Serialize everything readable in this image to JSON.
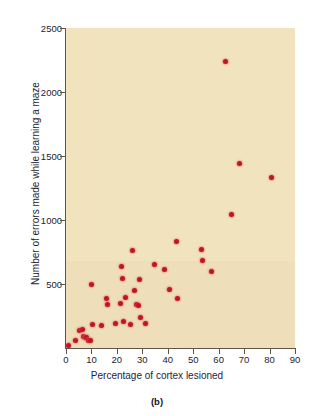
{
  "figure": {
    "panel_label": "(b)",
    "background_color": "#f2e3bf",
    "point_color": "#bd1626",
    "axis_color": "#5c5648",
    "text_color": "#1d2340"
  },
  "chart_data": {
    "type": "scatter",
    "title": "",
    "subtitle": "",
    "xlabel": "Percentage of cortex lesioned",
    "ylabel": "Number of errors made while learning a maze",
    "xlim": [
      0,
      90
    ],
    "ylim": [
      0,
      2500
    ],
    "xticks": [
      0,
      10,
      20,
      30,
      40,
      50,
      60,
      70,
      80,
      90
    ],
    "yticks": [
      0,
      500,
      1000,
      1500,
      2000,
      2500
    ],
    "xtick_labels": [
      "0",
      "10",
      "20",
      "30",
      "40",
      "50",
      "60",
      "70",
      "80",
      "90"
    ],
    "ytick_labels": [
      "0",
      "500",
      "1000",
      "1500",
      "2000",
      "2500"
    ],
    "grid": false,
    "legend": null,
    "annotations": [
      "(b)"
    ],
    "marker": "circle",
    "marker_color": "#bd1626",
    "series": [
      {
        "name": "Rats",
        "points": [
          [
            0.8,
            20
          ],
          [
            3.6,
            55
          ],
          [
            5.5,
            140
          ],
          [
            6.5,
            145
          ],
          [
            7.0,
            90
          ],
          [
            7.6,
            85
          ],
          [
            8.2,
            80
          ],
          [
            9.0,
            60
          ],
          [
            9.8,
            55
          ],
          [
            10.2,
            495
          ],
          [
            10.6,
            185
          ],
          [
            13.8,
            175
          ],
          [
            16.0,
            390
          ],
          [
            16.4,
            340
          ],
          [
            19.4,
            195
          ],
          [
            21.6,
            350
          ],
          [
            22.0,
            635
          ],
          [
            22.2,
            545
          ],
          [
            22.6,
            205
          ],
          [
            23.4,
            395
          ],
          [
            25.2,
            185
          ],
          [
            26.2,
            760
          ],
          [
            26.8,
            450
          ],
          [
            27.6,
            340
          ],
          [
            28.4,
            330
          ],
          [
            28.8,
            535
          ],
          [
            29.4,
            235
          ],
          [
            31.4,
            195
          ],
          [
            34.6,
            650
          ],
          [
            38.8,
            615
          ],
          [
            40.6,
            455
          ],
          [
            43.6,
            835
          ],
          [
            44.0,
            390
          ],
          [
            53.2,
            770
          ],
          [
            53.8,
            680
          ],
          [
            57.0,
            595
          ],
          [
            62.5,
            2240
          ],
          [
            65.0,
            1045
          ],
          [
            68.2,
            1440
          ],
          [
            80.6,
            1330
          ]
        ]
      }
    ]
  }
}
